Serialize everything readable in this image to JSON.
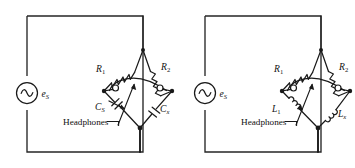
{
  "figure": {
    "background_color": "#ffffff",
    "line_color": "#1a1a1a",
    "frame_color": "#262626"
  },
  "circuits": [
    {
      "id": "capacitance-bridge",
      "name": "Capacitance comparison bridge",
      "source": {
        "symbol": "ac-source",
        "label": "e",
        "label_sub": "S"
      },
      "components": [
        {
          "id": "r1",
          "type": "resistor",
          "label": "R",
          "label_sub": "1",
          "arm": "upper-left"
        },
        {
          "id": "r2",
          "type": "resistor",
          "label": "R",
          "label_sub": "2",
          "arm": "upper-right"
        },
        {
          "id": "cs",
          "type": "variable-capacitor",
          "label": "C",
          "label_sub": "S",
          "arm": "lower-left"
        },
        {
          "id": "cx",
          "type": "capacitor",
          "label": "C",
          "label_sub": "x",
          "arm": "lower-right"
        }
      ],
      "detector": {
        "type": "headphones",
        "label": "Headphones"
      }
    },
    {
      "id": "inductance-bridge",
      "name": "Inductance comparison bridge",
      "source": {
        "symbol": "ac-source",
        "label": "e",
        "label_sub": "S"
      },
      "components": [
        {
          "id": "r1",
          "type": "resistor",
          "label": "R",
          "label_sub": "1",
          "arm": "upper-left"
        },
        {
          "id": "r2",
          "type": "resistor",
          "label": "R",
          "label_sub": "2",
          "arm": "upper-right"
        },
        {
          "id": "l1",
          "type": "inductor",
          "label": "L",
          "label_sub": "1",
          "arm": "lower-left"
        },
        {
          "id": "lx",
          "type": "inductor",
          "label": "L",
          "label_sub": "x",
          "arm": "lower-right"
        }
      ],
      "detector": {
        "type": "headphones",
        "label": "Headphones"
      }
    }
  ]
}
